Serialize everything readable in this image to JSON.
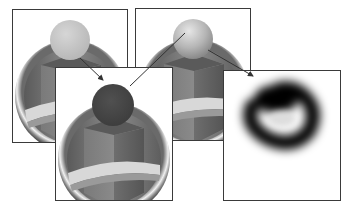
{
  "diagram": {
    "panels": [
      {
        "id": "panel-1",
        "label": "light sphere render",
        "sphere_color": "#c4c4c4"
      },
      {
        "id": "panel-2",
        "label": "dark sphere mask",
        "sphere_color": "#4a4a4a"
      },
      {
        "id": "panel-3",
        "label": "shaded sphere render",
        "sphere_color": "#bdbdbd"
      },
      {
        "id": "panel-4",
        "label": "blurred shadow map",
        "sphere_color": "#000000"
      }
    ],
    "arrows": [
      {
        "from": "panel-1",
        "to": "panel-2"
      },
      {
        "from": "panel-2",
        "to": "panel-3"
      },
      {
        "from": "panel-3",
        "to": "panel-4"
      }
    ],
    "colors": {
      "frame_border": "#3a3a3a",
      "arrow": "#333333",
      "background": "#ffffff"
    }
  }
}
